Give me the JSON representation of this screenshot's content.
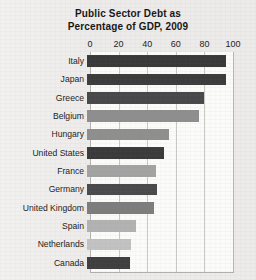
{
  "chart_data": {
    "type": "bar",
    "orientation": "horizontal",
    "title": "Public Sector Debt as Percentage of GDP, 2009",
    "title_lines": [
      "Public Sector Debt as",
      "Percentage of GDP, 2009"
    ],
    "xlabel": "",
    "ylabel": "",
    "xlim": [
      0,
      100
    ],
    "ticks": [
      0,
      20,
      40,
      60,
      80,
      100
    ],
    "tick_labels": [
      "0",
      "20",
      "40",
      "60",
      "80",
      "100"
    ],
    "grid": "vertical",
    "legend": "none",
    "categories": [
      "Italy",
      "Japan",
      "Greece",
      "Belgium",
      "Hungary",
      "United States",
      "France",
      "Germany",
      "United Kingdom",
      "Spain",
      "Netherlands",
      "Canada"
    ],
    "values": [
      97,
      97,
      82,
      78,
      57,
      54,
      48,
      49,
      47,
      34,
      31,
      30
    ],
    "bar_colors": [
      "#39393a",
      "#3c3c3d",
      "#48484a",
      "#8e8e8e",
      "#8f8f8f",
      "#3a3a3b",
      "#a3a3a3",
      "#4a4a4c",
      "#7d7d7e",
      "#b2b2b2",
      "#c2c2c2",
      "#3f3f40"
    ]
  },
  "style": {
    "plot_background": "#fbfbfa",
    "page_background": "#ecebe9",
    "gridline_color": "#c9c8c4",
    "axis_color": "#b6b5b2",
    "text_color": "#1b1b1b"
  }
}
